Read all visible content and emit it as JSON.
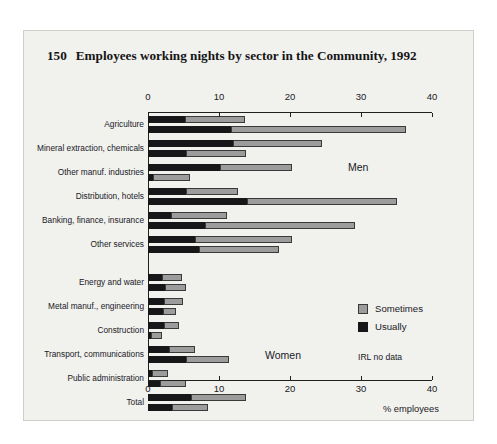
{
  "figure": {
    "number": "150",
    "title": "Employees working nights by sector in the Community, 1992",
    "note": "IRL no data"
  },
  "legend": {
    "items": [
      {
        "label": "Sometimes",
        "color": "#9c9c9c"
      },
      {
        "label": "Usually",
        "color": "#17171a"
      }
    ]
  },
  "groups": {
    "men": "Men",
    "women": "Women"
  },
  "axis": {
    "ticks": [
      "0",
      "10",
      "20",
      "30",
      "40"
    ],
    "label": "% employees"
  },
  "chart_data": {
    "type": "bar",
    "orientation": "horizontal",
    "stacked": true,
    "title": "Employees working nights by sector in the Community, 1992",
    "xlabel": "% employees",
    "ylabel": "",
    "xlim": [
      0,
      40
    ],
    "xticks": [
      0,
      10,
      20,
      30,
      40
    ],
    "grid": false,
    "legend_position": "right-bottom",
    "series": [
      {
        "name": "Usually",
        "color": "#17171a"
      },
      {
        "name": "Sometimes",
        "color": "#9c9c9c"
      }
    ],
    "panels": [
      {
        "name": "Men",
        "categories": [
          "Agriculture",
          "Mineral extraction, chemicals",
          "Other manuf. industries",
          "Distribution, hotels",
          "Banking, finance, insurance",
          "Other services"
        ],
        "bars": [
          {
            "category": "Agriculture",
            "rows": [
              {
                "usually": 5.2,
                "sometimes": 8.4,
                "total": 13.6
              },
              {
                "usually": 11.7,
                "sometimes": 24.6,
                "total": 36.3
              }
            ]
          },
          {
            "category": "Mineral extraction, chemicals",
            "rows": [
              {
                "usually": 12.0,
                "sometimes": 12.5,
                "total": 24.5
              },
              {
                "usually": 5.4,
                "sometimes": 8.4,
                "total": 13.8
              }
            ]
          },
          {
            "category": "Other manuf. industries",
            "rows": [
              {
                "usually": 10.1,
                "sometimes": 10.2,
                "total": 20.3
              },
              {
                "usually": 0.7,
                "sometimes": 5.2,
                "total": 5.9
              }
            ]
          },
          {
            "category": "Distribution, hotels",
            "rows": [
              {
                "usually": 5.4,
                "sometimes": 7.3,
                "total": 12.7
              },
              {
                "usually": 13.9,
                "sometimes": 21.2,
                "total": 35.1
              }
            ]
          },
          {
            "category": "Banking, finance, insurance",
            "rows": [
              {
                "usually": 3.3,
                "sometimes": 7.8,
                "total": 11.1
              },
              {
                "usually": 8.0,
                "sometimes": 21.2,
                "total": 29.2
              }
            ]
          },
          {
            "category": "Other services",
            "rows": [
              {
                "usually": 6.6,
                "sometimes": 13.7,
                "total": 20.3
              },
              {
                "usually": 7.2,
                "sometimes": 11.3,
                "total": 18.5
              }
            ]
          }
        ]
      },
      {
        "name": "Women",
        "categories": [
          "Energy and water",
          "Metal manuf., engineering",
          "Construction",
          "Transport, communications",
          "Public administration",
          "Total"
        ],
        "bars": [
          {
            "category": "Energy and water",
            "rows": [
              {
                "usually": 2.0,
                "sometimes": 2.8,
                "total": 4.8
              },
              {
                "usually": 2.4,
                "sometimes": 3.0,
                "total": 5.4
              }
            ]
          },
          {
            "category": "Metal manuf., engineering",
            "rows": [
              {
                "usually": 2.3,
                "sometimes": 2.6,
                "total": 4.9
              },
              {
                "usually": 2.1,
                "sometimes": 1.9,
                "total": 4.0
              }
            ]
          },
          {
            "category": "Construction",
            "rows": [
              {
                "usually": 2.2,
                "sometimes": 2.2,
                "total": 4.4
              },
              {
                "usually": 0.4,
                "sometimes": 1.6,
                "total": 2.0
              }
            ]
          },
          {
            "category": "Transport, communications",
            "rows": [
              {
                "usually": 3.0,
                "sometimes": 3.6,
                "total": 6.6
              },
              {
                "usually": 5.4,
                "sometimes": 6.0,
                "total": 11.4
              }
            ]
          },
          {
            "category": "Public administration",
            "rows": [
              {
                "usually": 0.5,
                "sometimes": 2.3,
                "total": 2.8
              },
              {
                "usually": 1.7,
                "sometimes": 3.6,
                "total": 5.3
              }
            ]
          },
          {
            "category": "Total",
            "rows": [
              {
                "usually": 6.0,
                "sometimes": 7.8,
                "total": 13.8
              },
              {
                "usually": 3.4,
                "sometimes": 5.0,
                "total": 8.4
              }
            ]
          }
        ]
      }
    ]
  }
}
